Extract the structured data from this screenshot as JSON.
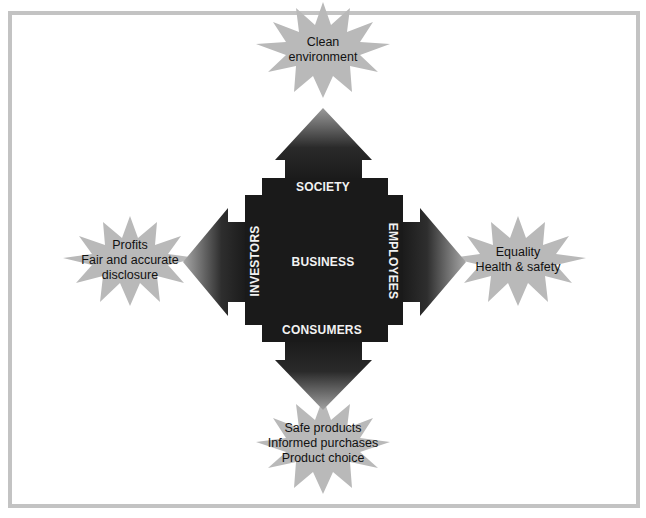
{
  "diagram": {
    "center_label": "BUSINESS",
    "stakeholders": {
      "top": {
        "label": "SOCIETY",
        "outcomes": [
          "Clean",
          "environment"
        ]
      },
      "left": {
        "label": "INVESTORS",
        "outcomes": [
          "Profits",
          "Fair and accurate",
          "disclosure"
        ]
      },
      "right": {
        "label": "EMPLOYEES",
        "outcomes": [
          "Equality",
          "Health & safety"
        ]
      },
      "bottom": {
        "label": "CONSUMERS",
        "outcomes": [
          "Safe products",
          "Informed purchases",
          "Product choice"
        ]
      }
    },
    "colors": {
      "frame": "#c3c3c3",
      "body": "#1a1a1a",
      "starburst": "#b9b9b9",
      "label_text": "#f2f2f2",
      "outcome_text": "#111111"
    }
  }
}
